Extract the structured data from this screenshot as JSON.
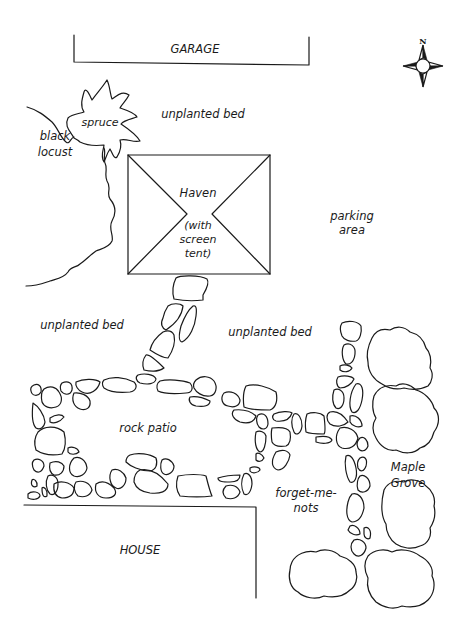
{
  "map": {
    "title": "Garden layout plan",
    "compass": {
      "label": "N"
    },
    "structures": {
      "garage": "GARAGE",
      "house": "HOUSE",
      "haven": {
        "name": "Haven",
        "note_lines": [
          "(with",
          "screen",
          "tent)"
        ]
      }
    },
    "trees": {
      "spruce": "spruce",
      "black_locust": [
        "black",
        "locust"
      ],
      "maple_grove": [
        "Maple",
        "Grove"
      ]
    },
    "areas": {
      "bed_top": "unplanted bed",
      "bed_left": "unplanted bed",
      "bed_right": "unplanted bed",
      "parking": [
        "parking",
        "area"
      ],
      "rock_patio": "rock patio",
      "forget_me_nots": [
        "forget-me-",
        "nots"
      ]
    },
    "colors": {
      "ink": "#1a1a1a",
      "background": "#ffffff"
    }
  }
}
